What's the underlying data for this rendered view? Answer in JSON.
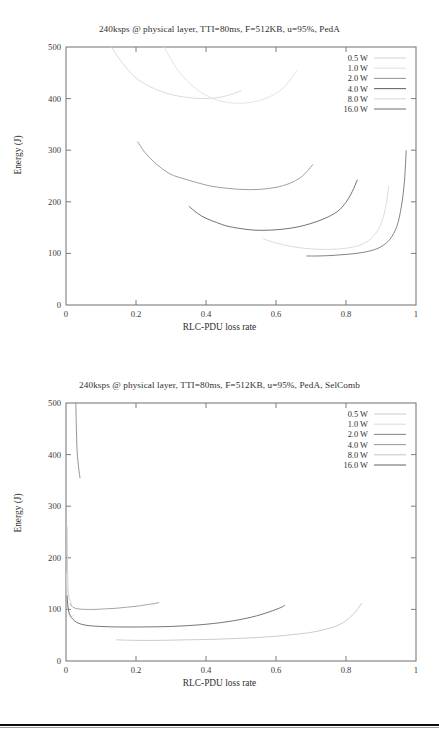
{
  "figure": {
    "background": "#ffffff",
    "rule_color": "#0c0c0c"
  },
  "charts": [
    {
      "id": "chart-pedA",
      "title": "240ksps @ physical layer, TTI=80ms, F=512KB, u=95%, PedA",
      "xlabel": "RLC-PDU loss rate",
      "ylabel": "Energy (J)"
    },
    {
      "id": "chart-pedA-selcomb",
      "title": "240ksps @ physical layer, TTI=80ms, F=512KB, u=95%, PedA, SelComb",
      "xlabel": "RLC-PDU loss rate",
      "ylabel": "Energy (J)"
    }
  ],
  "chart_data": [
    {
      "type": "line",
      "title": "240ksps @ physical layer, TTI=80ms, F=512KB, u=95%, PedA",
      "xlabel": "RLC-PDU loss rate",
      "ylabel": "Energy (J)",
      "xlim": [
        0,
        1
      ],
      "ylim": [
        0,
        500
      ],
      "xticks": [
        "0",
        "0.2",
        "0.4",
        "0.6",
        "0.8",
        "1"
      ],
      "xtickvals": [
        0,
        0.2,
        0.4,
        0.6,
        0.8,
        1
      ],
      "yticks": [
        "0",
        "100",
        "200",
        "300",
        "400",
        "500"
      ],
      "ytickvals": [
        0,
        100,
        200,
        300,
        400,
        500
      ],
      "grid": false,
      "legend_position": "top-right",
      "series": [
        {
          "name": "0.5 W",
          "color": "#d8d8d8",
          "x": [
            0.13,
            0.16,
            0.2,
            0.25,
            0.3,
            0.35,
            0.4,
            0.45,
            0.5
          ],
          "y": [
            500,
            470,
            440,
            420,
            408,
            402,
            400,
            404,
            415
          ]
        },
        {
          "name": "1.0 W",
          "color": "#e2e2e2",
          "x": [
            0.28,
            0.32,
            0.37,
            0.42,
            0.47,
            0.52,
            0.57,
            0.62,
            0.66
          ],
          "y": [
            500,
            455,
            420,
            400,
            392,
            392,
            400,
            420,
            455
          ]
        },
        {
          "name": "2.0 W",
          "color": "#9a9a9a",
          "x": [
            0.205,
            0.225,
            0.25,
            0.275,
            0.3,
            0.33,
            0.37,
            0.41,
            0.45,
            0.5,
            0.55,
            0.6,
            0.64,
            0.67,
            0.69,
            0.705
          ],
          "y": [
            316,
            296,
            278,
            264,
            253,
            246,
            238,
            231,
            227,
            224,
            224,
            228,
            236,
            247,
            260,
            272
          ]
        },
        {
          "name": "4.0 W",
          "color": "#6b6b6b",
          "x": [
            0.352,
            0.375,
            0.4,
            0.43,
            0.46,
            0.5,
            0.54,
            0.58,
            0.62,
            0.66,
            0.7,
            0.74,
            0.775,
            0.8,
            0.818,
            0.832
          ],
          "y": [
            191,
            178,
            168,
            160,
            153,
            148,
            145,
            145,
            147,
            151,
            158,
            168,
            181,
            199,
            220,
            242
          ]
        },
        {
          "name": "8.0 W",
          "color": "#dadada",
          "x": [
            0.565,
            0.6,
            0.64,
            0.68,
            0.72,
            0.76,
            0.8,
            0.84,
            0.87,
            0.895,
            0.912,
            0.922
          ],
          "y": [
            128,
            120,
            114,
            110,
            108,
            108,
            110,
            116,
            128,
            150,
            185,
            230
          ]
        },
        {
          "name": "16.0 W",
          "color": "#7c7c7c",
          "x": [
            0.688,
            0.72,
            0.76,
            0.8,
            0.84,
            0.875,
            0.9,
            0.925,
            0.945,
            0.958,
            0.967,
            0.972
          ],
          "y": [
            95,
            95,
            96,
            98,
            101,
            106,
            113,
            127,
            152,
            190,
            240,
            299
          ]
        }
      ]
    },
    {
      "type": "line",
      "title": "240ksps @ physical layer, TTI=80ms, F=512KB, u=95%, PedA, SelComb",
      "xlabel": "RLC-PDU loss rate",
      "ylabel": "Energy (J)",
      "xlim": [
        0,
        1
      ],
      "ylim": [
        0,
        500
      ],
      "xticks": [
        "0",
        "0.2",
        "0.4",
        "0.6",
        "0.8",
        "1"
      ],
      "xtickvals": [
        0,
        0.2,
        0.4,
        0.6,
        0.8,
        1
      ],
      "yticks": [
        "0",
        "100",
        "200",
        "300",
        "400",
        "500"
      ],
      "ytickvals": [
        0,
        100,
        200,
        300,
        400,
        500
      ],
      "grid": false,
      "legend_position": "top-right",
      "series": [
        {
          "name": "0.5 W",
          "color": "#cfcfcf",
          "x": [
            0.0035,
            0.004,
            0.005,
            0.006,
            0.008,
            0.011,
            0.015
          ],
          "y": [
            260,
            200,
            160,
            140,
            126,
            118,
            114
          ]
        },
        {
          "name": "1.0 W",
          "color": "#dcdcdc",
          "x": [
            0.002,
            0.003,
            0.004,
            0.006,
            0.009,
            0.013,
            0.018,
            0.024
          ],
          "y": [
            170,
            135,
            115,
            100,
            92,
            88,
            87,
            88
          ]
        },
        {
          "name": "2.0 W",
          "color": "#8d8d8d",
          "x": [
            0.028,
            0.029,
            0.03,
            0.031,
            0.032,
            0.034,
            0.036,
            0.038,
            0.04
          ],
          "y": [
            500,
            470,
            440,
            420,
            404,
            388,
            375,
            364,
            355
          ]
        },
        {
          "name": "4.0 W",
          "color": "#9f9f9f",
          "x": [
            0.012,
            0.02,
            0.035,
            0.055,
            0.08,
            0.11,
            0.14,
            0.17,
            0.2,
            0.23,
            0.25,
            0.265
          ],
          "y": [
            112,
            104,
            101,
            100,
            100,
            101,
            102,
            104,
            106,
            109,
            111,
            113
          ]
        },
        {
          "name": "8.0 W",
          "color": "#c9c9c9",
          "x": [
            0.145,
            0.2,
            0.27,
            0.34,
            0.42,
            0.5,
            0.58,
            0.66,
            0.72,
            0.78,
            0.82,
            0.845
          ],
          "y": [
            41,
            40,
            40,
            41,
            42,
            44,
            47,
            52,
            58,
            70,
            90,
            112
          ]
        },
        {
          "name": "16.0 W",
          "color": "#6f6f6f",
          "x": [
            0.003,
            0.006,
            0.012,
            0.03,
            0.06,
            0.1,
            0.15,
            0.22,
            0.3,
            0.38,
            0.46,
            0.53,
            0.58,
            0.615,
            0.625
          ],
          "y": [
            126,
            104,
            88,
            75,
            69,
            67,
            66,
            66,
            67,
            70,
            76,
            85,
            95,
            104,
            108
          ]
        }
      ]
    }
  ],
  "legend_entries": [
    "0.5 W",
    "1.0 W",
    "2.0 W",
    "4.0 W",
    "8.0 W",
    "16.0 W"
  ],
  "legend_colors": {
    "chart1": [
      "#d8d8d8",
      "#e2e2e2",
      "#9a9a9a",
      "#6b6b6b",
      "#dadada",
      "#7c7c7c"
    ],
    "chart2": [
      "#cfcfcf",
      "#dcdcdc",
      "#8d8d8d",
      "#9f9f9f",
      "#c9c9c9",
      "#6f6f6f"
    ]
  }
}
